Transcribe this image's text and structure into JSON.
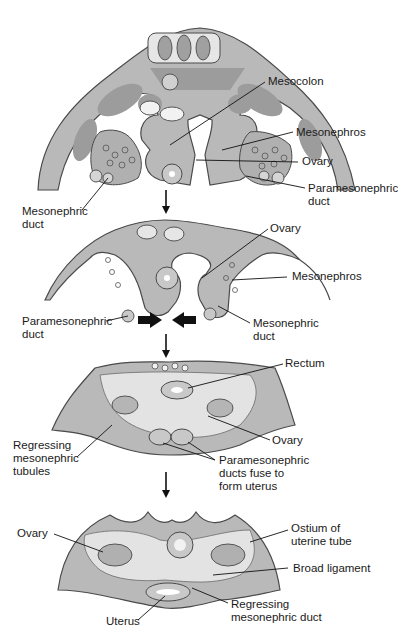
{
  "figure": {
    "title_cut_off": "",
    "colors": {
      "tissue": "#b9b9b9",
      "tissue_dark": "#9c9c9c",
      "cavity": "#e3e3e3",
      "outline": "#4a4a4a",
      "text": "#1a1a1a"
    },
    "stages": [
      {
        "id": "stage-1",
        "labels": {
          "mesocolon": "Mesocolon",
          "mesonephros": "Mesonephros",
          "ovary": "Ovary",
          "paramesonephric_duct": "Paramesonephric\nduct",
          "mesonephric_duct": "Mesonephric\nduct"
        }
      },
      {
        "id": "stage-2",
        "labels": {
          "ovary": "Ovary",
          "mesonephros": "Mesonephros",
          "paramesonephric_duct": "Paramesonephric\nduct",
          "mesonephric_duct": "Mesonephric\nduct"
        }
      },
      {
        "id": "stage-3",
        "labels": {
          "rectum": "Rectum",
          "ovary": "Ovary",
          "regressing_tubules": "Regressing\nmesonephric\ntubules",
          "ducts_fuse": "Paramesonephric\nducts fuse to\nform uterus"
        }
      },
      {
        "id": "stage-4",
        "labels": {
          "ovary": "Ovary",
          "ostium": "Ostium of\nuterine tube",
          "broad_ligament": "Broad ligament",
          "uterus": "Uterus",
          "regressing_duct": "Regressing\nmesonephric duct"
        }
      }
    ]
  }
}
